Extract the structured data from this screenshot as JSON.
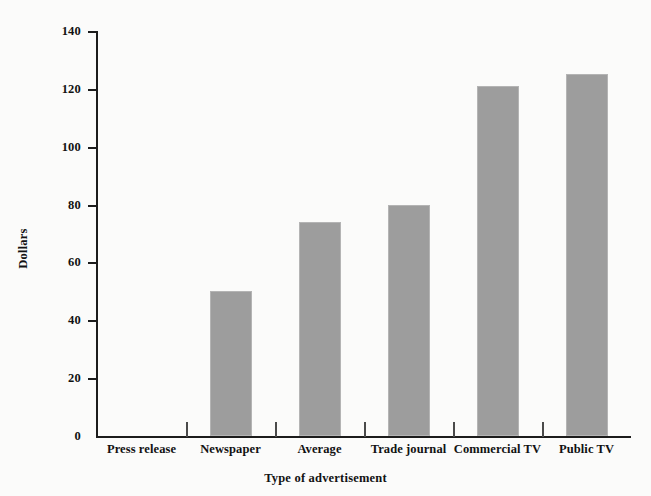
{
  "chart_data": {
    "type": "bar",
    "title": "",
    "subtitle": "",
    "xlabel": "Type of advertisement",
    "ylabel": "Dollars",
    "categories": [
      "Press release",
      "Newspaper",
      "Average",
      "Trade journal",
      "Commercial TV",
      "Public TV"
    ],
    "values": [
      0,
      50,
      74,
      80,
      121,
      125
    ],
    "series": [
      {
        "name": "Dollars",
        "values": [
          0,
          50,
          74,
          80,
          121,
          125
        ]
      }
    ],
    "ylim": [
      0,
      140
    ],
    "ytick_labels": [
      "0",
      "20",
      "40",
      "60",
      "80",
      "100",
      "120",
      "140"
    ],
    "ytick_values": [
      0,
      20,
      40,
      60,
      80,
      100,
      120,
      140
    ],
    "grid": false,
    "legend": false,
    "legend_position": "none",
    "bar_color": "#9d9d9d",
    "axis_color": "#1c1c1c",
    "background_color": "#fbfbfa",
    "text_color": "#121212"
  }
}
